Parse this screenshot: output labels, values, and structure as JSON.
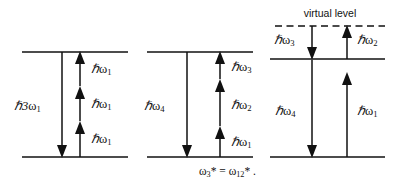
{
  "figure": {
    "background_color": "#ffffff",
    "line_color": "#111111",
    "width": 396,
    "height": 186
  },
  "panels": [
    {
      "id": "panel-1",
      "name": "third-harmonic-generation",
      "levels": [
        {
          "name": "upper-level",
          "style": "solid",
          "y": 52
        },
        {
          "name": "ground-level",
          "style": "solid",
          "y": 157
        }
      ],
      "emission": {
        "label": "ℏ3ω₁",
        "label_base": "ℏ3",
        "label_omega": "ω",
        "label_sub": "1",
        "direction": "down"
      },
      "absorptions": [
        {
          "label_base": "ℏ",
          "label_omega": "ω",
          "label_sub": "1",
          "label": "ℏω₁",
          "direction": "up"
        },
        {
          "label_base": "ℏ",
          "label_omega": "ω",
          "label_sub": "1",
          "label": "ℏω₁",
          "direction": "up"
        },
        {
          "label_base": "ℏ",
          "label_omega": "ω",
          "label_sub": "1",
          "label": "ℏω₁",
          "direction": "up"
        }
      ]
    },
    {
      "id": "panel-2",
      "name": "sum-frequency-mixing",
      "levels": [
        {
          "name": "upper-level",
          "style": "solid",
          "y": 52
        },
        {
          "name": "ground-level",
          "style": "solid",
          "y": 157
        }
      ],
      "emission": {
        "label": "ℏω₄",
        "label_base": "ℏ",
        "label_omega": "ω",
        "label_sub": "4",
        "direction": "down"
      },
      "absorptions": [
        {
          "label_base": "ℏ",
          "label_omega": "ω",
          "label_sub": "3",
          "label": "ℏω₃",
          "direction": "up"
        },
        {
          "label_base": "ℏ",
          "label_omega": "ω",
          "label_sub": "2",
          "label": "ℏω₂",
          "direction": "up"
        },
        {
          "label_base": "ℏ",
          "label_omega": "ω",
          "label_sub": "1",
          "label": "ℏω₁",
          "direction": "up"
        }
      ],
      "caption": {
        "text": "ω₃* = ω₁₂*.",
        "part_omega_a": "ω",
        "part_sub_a": "3",
        "part_star_a": "*",
        "part_equals": " = ",
        "part_omega_b": "ω",
        "part_sub_b": "12",
        "part_star_b": "*",
        "part_period": " ."
      }
    },
    {
      "id": "panel-3",
      "name": "four-wave-mixing-virtual-level",
      "levels": [
        {
          "name": "virtual-level",
          "style": "dashed",
          "y": 26,
          "label": "virtual level"
        },
        {
          "name": "intermediate-level",
          "style": "solid",
          "y": 59
        },
        {
          "name": "ground-level",
          "style": "solid",
          "y": 157
        }
      ],
      "transitions": [
        {
          "name": "omega-3-emission",
          "label_base": "ℏ",
          "label_omega": "ω",
          "label_sub": "3",
          "label": "ℏω₃",
          "direction": "down",
          "from": "virtual-level",
          "to": "intermediate-level"
        },
        {
          "name": "omega-2-absorption",
          "label_base": "ℏ",
          "label_omega": "ω",
          "label_sub": "2",
          "label": "ℏω₂",
          "direction": "up",
          "from": "intermediate-level",
          "to": "virtual-level"
        },
        {
          "name": "omega-4-emission",
          "label_base": "ℏ",
          "label_omega": "ω",
          "label_sub": "4",
          "label": "ℏω₄",
          "direction": "down",
          "from": "virtual-level",
          "to": "ground-level"
        },
        {
          "name": "omega-1-absorption",
          "label_base": "ℏ",
          "label_omega": "ω",
          "label_sub": "1",
          "label": "ℏω₁",
          "direction": "up",
          "from": "ground-level",
          "to": "intermediate-level"
        }
      ]
    }
  ]
}
